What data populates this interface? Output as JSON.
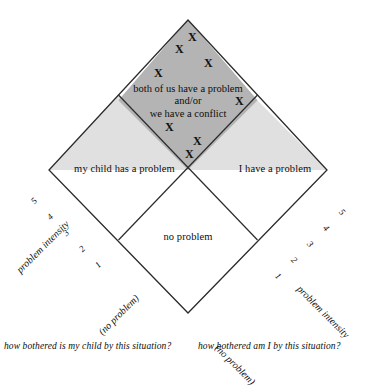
{
  "figure": {
    "type": "conceptual-diagram",
    "shape": "diamond-quadrants",
    "background": "#ffffff",
    "line_color": "#2b2b2b",
    "colors": {
      "top_quadrant_fill": "#b4b4b4",
      "side_quadrant_fill": "#e0e0e0",
      "bottom_quadrant_fill": "#ffffff",
      "stroke": "#2b2b2b",
      "text": "#0d0d0d"
    }
  },
  "quadrants": {
    "top": {
      "name": "conflict-quadrant",
      "lines": [
        "both of us have a problem",
        "and/or",
        "we have a conflict"
      ],
      "fill": "#b4b4b4"
    },
    "left": {
      "name": "child-problem-quadrant",
      "label": "my child has a problem",
      "fill": "#e0e0e0"
    },
    "right": {
      "name": "my-problem-quadrant",
      "label": "I have a problem",
      "fill": "#e0e0e0"
    },
    "bottom": {
      "name": "no-problem-quadrant",
      "label": "no problem",
      "fill": "#ffffff"
    }
  },
  "marks": {
    "symbol": "X",
    "count": 8,
    "region": "top",
    "points": [
      {
        "x": 192,
        "y": 37
      },
      {
        "x": 179,
        "y": 49
      },
      {
        "x": 208,
        "y": 63
      },
      {
        "x": 158,
        "y": 73
      },
      {
        "x": 239,
        "y": 101
      },
      {
        "x": 169,
        "y": 127
      },
      {
        "x": 197,
        "y": 141
      },
      {
        "x": 189,
        "y": 154
      }
    ]
  },
  "axes": {
    "left": {
      "name": "problem intensity",
      "ticks": [
        "5",
        "4",
        "3",
        "2",
        "1"
      ],
      "origin_label": "(no problem)",
      "caption": "how bothered is my child by this situation?"
    },
    "right": {
      "name": "problem intensity",
      "ticks": [
        "1",
        "2",
        "3",
        "4",
        "5"
      ],
      "origin_label": "(no problem)",
      "caption": "how bothered am I by this situation?"
    }
  }
}
